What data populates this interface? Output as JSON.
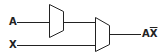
{
  "diagram": {
    "title": "",
    "inputs": [
      {
        "label": "A"
      },
      {
        "label": "X"
      }
    ],
    "blocks": [
      {
        "name": "first-block",
        "type": "trapezoid"
      },
      {
        "name": "second-block",
        "type": "trapezoid"
      }
    ],
    "output": {
      "label_main": "A",
      "label_bar": "X"
    },
    "colors": {
      "stroke": "#222222",
      "background": "#ffffff"
    }
  }
}
